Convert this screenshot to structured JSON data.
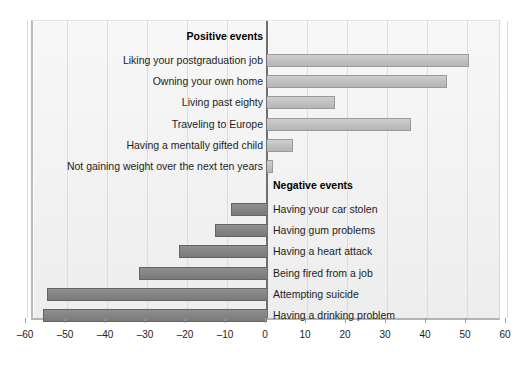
{
  "chart_data": {
    "type": "bar",
    "orientation": "horizontal",
    "title": "",
    "xlabel": "",
    "ylabel": "",
    "xlim": [
      -60,
      60
    ],
    "xticks": [
      -60,
      -50,
      -40,
      -30,
      -20,
      -10,
      0,
      10,
      20,
      30,
      40,
      50,
      60
    ],
    "xtick_labels": [
      "–60",
      "–50",
      "–40",
      "–30",
      "–20",
      "–10",
      "0",
      "10",
      "20",
      "30",
      "40",
      "50",
      "60"
    ],
    "grid": true,
    "legend": "none",
    "groups": [
      {
        "name": "Positive events",
        "label_side": "left",
        "categories": [
          "Liking your postgraduation job",
          "Owning your own home",
          "Living past eighty",
          "Traveling to Europe",
          "Having a mentally gifted child",
          "Not gaining weight over the next ten years"
        ],
        "values": [
          50.5,
          45,
          17,
          36,
          6.5,
          1.5
        ]
      },
      {
        "name": "Negative events",
        "label_side": "right",
        "categories": [
          "Having your car stolen",
          "Having gum problems",
          "Having a heart attack",
          "Being fired from a job",
          "Attempting suicide",
          "Having a drinking problem"
        ],
        "values": [
          -9,
          -13,
          -22,
          -32,
          -55,
          -56
        ]
      }
    ]
  },
  "colors": {
    "positive_bar": "#c2c2c2",
    "positive_bar_border": "#9a9a9a",
    "negative_bar": "#858585",
    "negative_bar_border": "#636363",
    "plot_background": "#f2f2f2",
    "gridline": "#dcdcdc",
    "zeroline": "#6f6f6f",
    "text": "#1d1d1d"
  }
}
